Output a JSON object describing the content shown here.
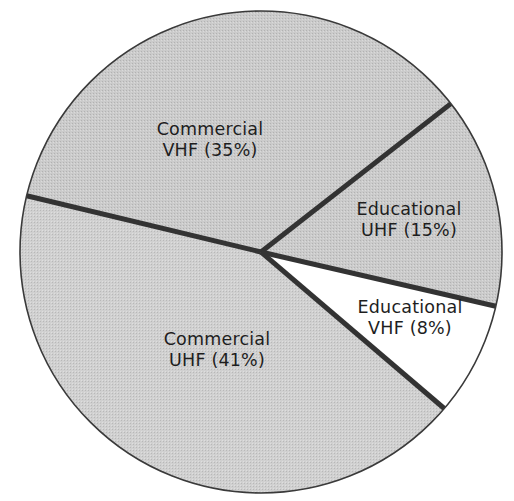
{
  "chart_data": {
    "type": "pie",
    "title": "",
    "slices": [
      {
        "name": "Commercial VHF",
        "value": 35,
        "label_line1": "Commercial",
        "label_line2": "VHF (35%)",
        "fill": "#c9c9c9"
      },
      {
        "name": "Educational UHF",
        "value": 15,
        "label_line1": "Educational",
        "label_line2": "UHF (15%)",
        "fill": "#c9c9c9"
      },
      {
        "name": "Educational VHF",
        "value": 8,
        "label_line1": "Educational",
        "label_line2": "VHF (8%)",
        "fill": "#ffffff"
      },
      {
        "name": "Commercial UHF",
        "value": 41,
        "label_line1": "Commercial",
        "label_line2": "UHF (41%)",
        "fill": "#cfcfcf"
      }
    ],
    "units": "%",
    "legend": "none (labels inside slices)",
    "geometry": {
      "cx": 261,
      "cy": 252,
      "r": 241
    },
    "divider_color": "#333333",
    "label_positions": [
      {
        "x": 210,
        "y": 140
      },
      {
        "x": 409,
        "y": 220
      },
      {
        "x": 410,
        "y": 318
      },
      {
        "x": 217,
        "y": 350
      }
    ]
  }
}
